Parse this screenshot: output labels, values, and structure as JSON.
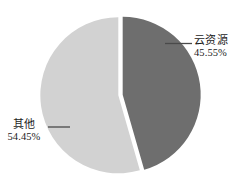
{
  "chart_data": {
    "type": "pie",
    "title": "",
    "subtitle": "",
    "xlabel": "",
    "ylabel": "",
    "legend": "none",
    "grid": false,
    "labels_outside": true,
    "start_angle_deg": 0,
    "direction": "clockwise",
    "exploded": true,
    "categories": [
      "云资源",
      "其他"
    ],
    "values": [
      45.55,
      54.45
    ],
    "value_unit": "%",
    "slices": [
      {
        "name": "云资源",
        "value": 45.55,
        "value_text": "45.55%",
        "color": "#6e6e6e",
        "position": "right"
      },
      {
        "name": "其他",
        "value": 54.45,
        "value_text": "54.45%",
        "color": "#d2d2d2",
        "position": "left"
      }
    ]
  },
  "labels": {
    "cloud": {
      "name": "云资源",
      "value_text": "45.55%"
    },
    "other": {
      "name": "其他",
      "value_text": "54.45%"
    }
  },
  "colors": {
    "background": "#ffffff",
    "slice_dark": "#6e6e6e",
    "slice_light": "#d2d2d2",
    "leader_line": "#4a4a4a",
    "text": "#1c1c1c",
    "gap": "#ffffff"
  }
}
